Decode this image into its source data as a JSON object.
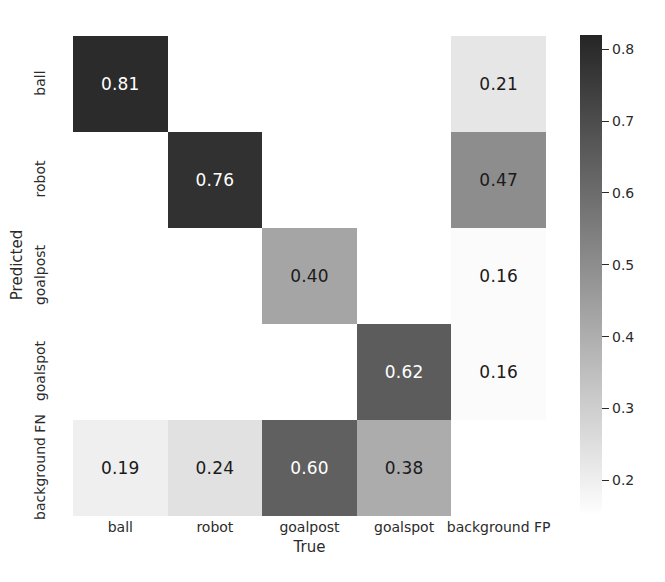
{
  "chart_data": {
    "type": "heatmap",
    "title": "",
    "xlabel": "True",
    "ylabel": "Predicted",
    "x_categories": [
      "ball",
      "robot",
      "goalpost",
      "goalspot",
      "background FP"
    ],
    "y_categories": [
      "ball",
      "robot",
      "goalpost",
      "goalspot",
      "background FN"
    ],
    "colormap": "Greys",
    "grid": false,
    "legend": "colorbar-right",
    "colorbar": {
      "vmin": 0.15,
      "vmax": 0.82,
      "ticks": [
        0.2,
        0.3,
        0.4,
        0.5,
        0.6,
        0.7,
        0.8
      ],
      "tick_labels": [
        "0.2",
        "0.3",
        "0.4",
        "0.5",
        "0.6",
        "0.7",
        "0.8"
      ]
    },
    "matrix": [
      [
        0.81,
        null,
        null,
        null,
        0.21
      ],
      [
        null,
        0.76,
        null,
        null,
        0.47
      ],
      [
        null,
        null,
        0.4,
        null,
        0.16
      ],
      [
        null,
        null,
        null,
        0.62,
        0.16
      ],
      [
        0.19,
        0.24,
        0.6,
        0.38,
        null
      ]
    ],
    "cells": [
      {
        "row": 0,
        "col": 0,
        "label": "0.81",
        "value": 0.81,
        "bg": "#2b2b2b",
        "fg": "#ffffff"
      },
      {
        "row": 0,
        "col": 4,
        "label": "0.21",
        "value": 0.21,
        "bg": "#e6e6e6",
        "fg": "#1a1a1a"
      },
      {
        "row": 1,
        "col": 1,
        "label": "0.76",
        "value": 0.76,
        "bg": "#313131",
        "fg": "#ffffff"
      },
      {
        "row": 1,
        "col": 4,
        "label": "0.47",
        "value": 0.47,
        "bg": "#8d8d8d",
        "fg": "#1a1a1a"
      },
      {
        "row": 2,
        "col": 2,
        "label": "0.40",
        "value": 0.4,
        "bg": "#a5a5a5",
        "fg": "#1a1a1a"
      },
      {
        "row": 2,
        "col": 4,
        "label": "0.16",
        "value": 0.16,
        "bg": "#fbfbfb",
        "fg": "#1a1a1a"
      },
      {
        "row": 3,
        "col": 3,
        "label": "0.62",
        "value": 0.62,
        "bg": "#5c5c5c",
        "fg": "#ffffff"
      },
      {
        "row": 3,
        "col": 4,
        "label": "0.16",
        "value": 0.16,
        "bg": "#fbfbfb",
        "fg": "#1a1a1a"
      },
      {
        "row": 4,
        "col": 0,
        "label": "0.19",
        "value": 0.19,
        "bg": "#efefef",
        "fg": "#1a1a1a"
      },
      {
        "row": 4,
        "col": 1,
        "label": "0.24",
        "value": 0.24,
        "bg": "#e1e1e1",
        "fg": "#1a1a1a"
      },
      {
        "row": 4,
        "col": 2,
        "label": "0.60",
        "value": 0.6,
        "bg": "#606060",
        "fg": "#ffffff"
      },
      {
        "row": 4,
        "col": 3,
        "label": "0.38",
        "value": 0.38,
        "bg": "#acacac",
        "fg": "#1a1a1a"
      }
    ]
  }
}
